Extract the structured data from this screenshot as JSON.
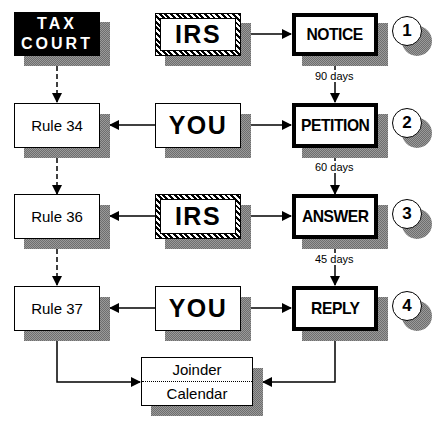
{
  "diagram": {
    "type": "flowchart",
    "colors": {
      "ink": "#000000",
      "paper": "#ffffff",
      "shadow": "#8a8a8a"
    },
    "left_column": {
      "tax_court": {
        "line1": "TAX",
        "line2": "COURT"
      },
      "rules": [
        {
          "label": "Rule 34"
        },
        {
          "label": "Rule 36"
        },
        {
          "label": "Rule 37"
        }
      ]
    },
    "middle_column": {
      "actors": [
        {
          "label": "IRS",
          "style": "hatched"
        },
        {
          "label": "YOU",
          "style": "plain"
        },
        {
          "label": "IRS",
          "style": "hatched"
        },
        {
          "label": "YOU",
          "style": "plain"
        }
      ]
    },
    "right_column": {
      "steps": [
        {
          "label": "NOTICE",
          "number": "1"
        },
        {
          "label": "PETITION",
          "number": "2"
        },
        {
          "label": "ANSWER",
          "number": "3"
        },
        {
          "label": "REPLY",
          "number": "4"
        }
      ],
      "intervals": [
        {
          "label": "90 days"
        },
        {
          "label": "60 days"
        },
        {
          "label": "45 days"
        }
      ]
    },
    "bottom": {
      "joinder": "Joinder",
      "calendar": "Calendar"
    }
  }
}
